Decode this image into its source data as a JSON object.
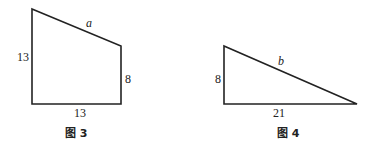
{
  "figures": [
    {
      "caption": "图 3",
      "shape": "right trapezoid",
      "labels": {
        "slant_side": "a",
        "left_side": "13",
        "right_side": "8",
        "bottom_side": "13"
      }
    },
    {
      "caption": "图 4",
      "shape": "right triangle",
      "labels": {
        "hypotenuse": "b",
        "left_side": "8",
        "bottom_side": "21"
      }
    }
  ],
  "colors": {
    "stroke": "#222222",
    "background": "#ffffff"
  }
}
